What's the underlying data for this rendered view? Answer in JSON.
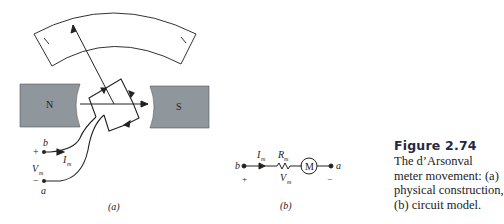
{
  "figure": {
    "title": "Figure 2.74",
    "caption": "The d’Arsonval meter movement: (a) physical construction, (b) circuit model."
  },
  "part_a": {
    "label": "(a)",
    "magnet_left": "N",
    "magnet_right": "S",
    "terminal_b": "b",
    "terminal_a": "a",
    "plus": "+",
    "minus": "−",
    "voltage": "V",
    "voltage_sub": "m",
    "current": "I",
    "current_sub": "m"
  },
  "part_b": {
    "label": "(b)",
    "terminal_b": "b",
    "terminal_a": "a",
    "plus": "+",
    "minus": "−",
    "current": "I",
    "current_sub": "m",
    "resistance": "R",
    "resistance_sub": "m",
    "voltage": "V",
    "voltage_sub": "m",
    "meter": "M"
  },
  "colors": {
    "magnet_fill": "#8f969c",
    "line": "#222222",
    "title": "#1f2a44"
  }
}
